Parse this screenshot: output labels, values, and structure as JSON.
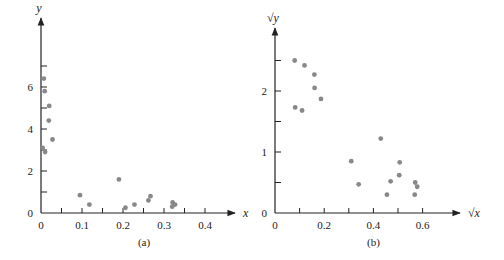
{
  "chart_data": [
    {
      "id": "a",
      "type": "scatter",
      "caption": "(a)",
      "xlabel": "x",
      "ylabel": "y",
      "xlim": [
        0,
        0.44
      ],
      "ylim": [
        0,
        7.5
      ],
      "xticks_major": [
        0,
        0.1,
        0.2,
        0.3,
        0.4
      ],
      "xtick_labels": [
        "0",
        "0.1",
        "0.2",
        "0.3",
        "0.4"
      ],
      "xticks_minor": [
        0.05,
        0.15,
        0.25,
        0.35
      ],
      "yticks_major": [
        0,
        2,
        4,
        6
      ],
      "ytick_labels": [
        "0",
        "2",
        "4",
        "6"
      ],
      "yticks_minor": [
        1,
        3,
        5,
        7
      ],
      "grid": false,
      "points": [
        {
          "x": 0.004,
          "y": 3.1
        },
        {
          "x": 0.007,
          "y": 6.4
        },
        {
          "x": 0.009,
          "y": 5.8
        },
        {
          "x": 0.01,
          "y": 2.9
        },
        {
          "x": 0.02,
          "y": 5.1
        },
        {
          "x": 0.019,
          "y": 4.4
        },
        {
          "x": 0.028,
          "y": 3.5
        },
        {
          "x": 0.095,
          "y": 0.85
        },
        {
          "x": 0.118,
          "y": 0.4
        },
        {
          "x": 0.19,
          "y": 1.6
        },
        {
          "x": 0.206,
          "y": 0.25
        },
        {
          "x": 0.228,
          "y": 0.4
        },
        {
          "x": 0.262,
          "y": 0.6
        },
        {
          "x": 0.267,
          "y": 0.8
        },
        {
          "x": 0.32,
          "y": 0.3
        },
        {
          "x": 0.321,
          "y": 0.5
        },
        {
          "x": 0.327,
          "y": 0.4
        }
      ]
    },
    {
      "id": "b",
      "type": "scatter",
      "caption": "(b)",
      "xlabel": "√x",
      "ylabel": "√y",
      "xlim": [
        0,
        0.72
      ],
      "ylim": [
        0,
        2.8
      ],
      "xticks_major": [
        0,
        0.2,
        0.4,
        0.6
      ],
      "xtick_labels": [
        "0",
        "0.2",
        "0.4",
        "0.6"
      ],
      "xticks_minor": [
        0.1,
        0.3,
        0.5
      ],
      "yticks_major": [
        0,
        1,
        2
      ],
      "ytick_labels": [
        "0",
        "1",
        "2"
      ],
      "yticks_minor": [
        0.5,
        1.5,
        2.5
      ],
      "grid": false,
      "points": [
        {
          "x": 0.08,
          "y": 2.5
        },
        {
          "x": 0.12,
          "y": 2.42
        },
        {
          "x": 0.16,
          "y": 2.27
        },
        {
          "x": 0.161,
          "y": 2.05
        },
        {
          "x": 0.187,
          "y": 1.87
        },
        {
          "x": 0.082,
          "y": 1.73
        },
        {
          "x": 0.11,
          "y": 1.68
        },
        {
          "x": 0.31,
          "y": 0.85
        },
        {
          "x": 0.34,
          "y": 0.47
        },
        {
          "x": 0.43,
          "y": 1.22
        },
        {
          "x": 0.455,
          "y": 0.3
        },
        {
          "x": 0.47,
          "y": 0.52
        },
        {
          "x": 0.505,
          "y": 0.62
        },
        {
          "x": 0.507,
          "y": 0.83
        },
        {
          "x": 0.568,
          "y": 0.3
        },
        {
          "x": 0.57,
          "y": 0.5
        },
        {
          "x": 0.578,
          "y": 0.43
        }
      ]
    }
  ],
  "layout": {
    "a": {
      "origin_x": 41,
      "origin_y": 213,
      "px_per_x": 410,
      "px_per_y": 21.0,
      "x_axis_end": 235,
      "y_axis_top": 18
    },
    "b": {
      "origin_x": 275,
      "origin_y": 213,
      "px_per_x": 246,
      "px_per_y": 61.0,
      "x_axis_end": 460,
      "y_axis_top": 28
    }
  },
  "colors": {
    "axis": "#222222",
    "point": "#888888",
    "text": "#222222"
  }
}
